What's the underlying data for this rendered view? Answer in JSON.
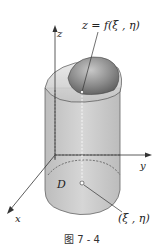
{
  "figure": {
    "caption": "图 7 - 4",
    "labels": {
      "surface": "z = f(ξ , η)",
      "z_axis": "z",
      "y_axis": "y",
      "x_axis": "x",
      "region": "D",
      "point": "(ξ , η)"
    },
    "colors": {
      "cylinder_fill": "#cfcfcf",
      "dome_fill": "#8a8a8a",
      "axis": "#333333",
      "background": "#ffffff"
    }
  }
}
